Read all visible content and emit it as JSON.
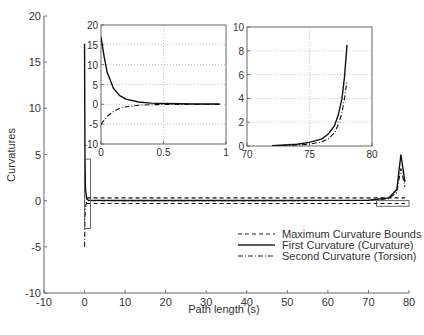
{
  "chart_data": [
    {
      "id": "main",
      "type": "line",
      "title": "",
      "xlabel": "Path length (s)",
      "ylabel": "Curvatures",
      "xlim": [
        -10,
        80
      ],
      "ylim": [
        -10,
        20
      ],
      "xticks": [
        -10,
        0,
        10,
        20,
        30,
        40,
        50,
        60,
        70,
        80
      ],
      "yticks": [
        -10,
        -5,
        0,
        5,
        10,
        15,
        20
      ],
      "grid": false,
      "legend_position": "lower right",
      "series": [
        {
          "name": "Maximum Curvature Bounds",
          "style": "dashed",
          "x": [
            0.5,
            79
          ],
          "y_upper": [
            0.3,
            0.3
          ],
          "y_lower": [
            -0.3,
            -0.3
          ]
        },
        {
          "name": "First Curvature (Curvature)",
          "style": "solid",
          "x": [
            0,
            0.05,
            0.1,
            0.2,
            0.5,
            1,
            10,
            40,
            70,
            75,
            77,
            78,
            79
          ],
          "y": [
            17,
            10,
            5,
            1.5,
            0.2,
            0.05,
            0.02,
            0.02,
            0.05,
            0.3,
            1.2,
            5,
            2
          ]
        },
        {
          "name": "Second Curvature (Torsion)",
          "style": "dashdot",
          "x": [
            0,
            0.1,
            0.2,
            0.5,
            1,
            40,
            70,
            75,
            77,
            78,
            79
          ],
          "y": [
            -5,
            -2,
            -0.8,
            -0.1,
            0,
            0,
            0.02,
            0.2,
            0.9,
            3.5,
            1.5
          ]
        }
      ],
      "annotations": [
        "zoom box near s=0 (x 0 to 1, y -3 to 4.5)",
        "zoom box near s=78 (x 72 to 80, y -0.6 to 0)"
      ]
    },
    {
      "id": "inset-start",
      "type": "line",
      "xlim": [
        0,
        1
      ],
      "ylim": [
        -10,
        20
      ],
      "xticks": [
        0,
        0.5,
        1
      ],
      "yticks": [
        -10,
        -5,
        0,
        5,
        10,
        15,
        20
      ],
      "grid": true,
      "series": [
        {
          "name": "First Curvature (Curvature)",
          "style": "solid",
          "x": [
            0,
            0.025,
            0.05,
            0.1,
            0.15,
            0.2,
            0.3,
            0.4,
            0.5,
            0.75,
            0.95
          ],
          "y": [
            17,
            12,
            8,
            4,
            2.2,
            1.3,
            0.6,
            0.3,
            0.2,
            0.1,
            0.1
          ]
        },
        {
          "name": "Second Curvature (Torsion)",
          "style": "dashdot",
          "x": [
            0,
            0.05,
            0.1,
            0.15,
            0.2,
            0.3,
            0.4,
            0.5,
            0.75,
            0.95
          ],
          "y": [
            -5,
            -3,
            -1.8,
            -1,
            -0.6,
            -0.25,
            -0.1,
            -0.05,
            0,
            0
          ]
        }
      ]
    },
    {
      "id": "inset-end",
      "type": "line",
      "xlim": [
        70,
        80
      ],
      "ylim": [
        0,
        10
      ],
      "xticks": [
        70,
        75,
        80
      ],
      "yticks": [
        0,
        2,
        4,
        6,
        8,
        10
      ],
      "grid": true,
      "series": [
        {
          "name": "First Curvature (Curvature)",
          "style": "solid",
          "x": [
            72,
            73,
            74,
            75,
            76,
            76.5,
            77,
            77.3,
            77.6,
            77.8,
            78
          ],
          "y": [
            0.02,
            0.08,
            0.15,
            0.3,
            0.6,
            1.0,
            1.7,
            2.6,
            4.0,
            5.8,
            8.5
          ]
        },
        {
          "name": "Second Curvature (Torsion)",
          "style": "dashdot",
          "x": [
            72,
            73,
            74,
            75,
            76,
            76.5,
            77,
            77.3,
            77.6,
            77.8,
            78
          ],
          "y": [
            0.0,
            0.04,
            0.08,
            0.15,
            0.35,
            0.6,
            1.1,
            1.8,
            2.8,
            4.0,
            5.5
          ]
        }
      ]
    }
  ],
  "legend": {
    "entries": [
      "Maximum Curvature Bounds",
      "First Curvature (Curvature)",
      "Second Curvature (Torsion)"
    ]
  },
  "axes": {
    "xlabel": "Path length (s)",
    "ylabel": "Curvatures"
  }
}
